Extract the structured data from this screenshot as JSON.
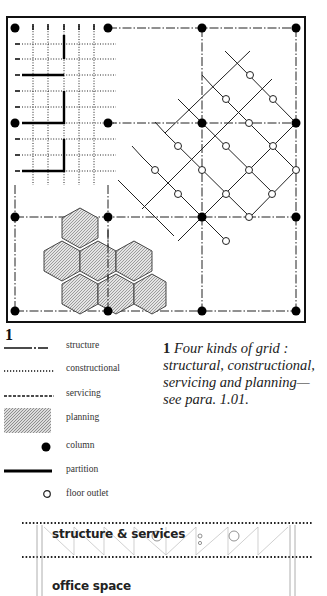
{
  "figure": {
    "number": "1",
    "caption_number": "1",
    "caption_text": "Four kinds of grid : structural, constructional, servicing and planning—see para. 1.01."
  },
  "diagram": {
    "title": "Four kinds of grid",
    "frame": {
      "x": 7,
      "y": 17,
      "w": 298,
      "h": 305
    },
    "structure_columns_x": [
      15,
      108,
      202,
      296
    ],
    "structure_rows_y": [
      28,
      123,
      217,
      311
    ],
    "colors": {
      "ink": "#111111",
      "planning_fill": "#c8c8c8",
      "background": "#ffffff"
    }
  },
  "legend": {
    "items": [
      {
        "key": "structure",
        "label": "structure",
        "symbol": "dash-dot-line"
      },
      {
        "key": "constructional",
        "label": "constructional",
        "symbol": "dotted-line"
      },
      {
        "key": "servicing",
        "label": "servicing",
        "symbol": "dashed-line"
      },
      {
        "key": "planning",
        "label": "planning",
        "symbol": "hatched-area"
      },
      {
        "key": "column",
        "label": "column",
        "symbol": "filled-circle"
      },
      {
        "key": "partition",
        "label": "partition",
        "symbol": "thick-line"
      },
      {
        "key": "floor_outlet",
        "label": "floor outlet",
        "symbol": "open-circle"
      }
    ]
  },
  "section": {
    "upper_label": "structure & services",
    "lower_label": "office space"
  }
}
